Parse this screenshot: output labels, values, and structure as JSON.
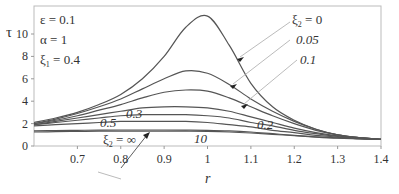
{
  "chart_data": {
    "type": "line",
    "title": "",
    "xlabel": "r",
    "ylabel": "τ",
    "xlim": [
      0.6,
      1.4
    ],
    "ylim": [
      0,
      12.5
    ],
    "xticks": [
      "0.7",
      "0.8",
      "0.9",
      "1",
      "1.1",
      "1.2",
      "1.3",
      "1.4"
    ],
    "yticks": [
      "0",
      "2",
      "4",
      "6",
      "8",
      "10"
    ],
    "grid": false,
    "parameters": [
      "ε = 0.1",
      "α = 1",
      "ξ₁ = 0.4"
    ],
    "legend_title": "ξ₂",
    "x": [
      0.6,
      0.65,
      0.7,
      0.75,
      0.8,
      0.85,
      0.9,
      0.95,
      1.0,
      1.05,
      1.1,
      1.15,
      1.2,
      1.25,
      1.3,
      1.35,
      1.4
    ],
    "series": [
      {
        "name": "ξ₂ = 0",
        "label": "ξ₂ = 0",
        "values": [
          2.1,
          2.5,
          3.0,
          3.7,
          4.6,
          6.0,
          8.0,
          10.6,
          11.6,
          9.0,
          5.6,
          3.5,
          2.3,
          1.5,
          1.0,
          0.75,
          0.6
        ]
      },
      {
        "name": "0.05",
        "label": "0.05",
        "values": [
          2.0,
          2.4,
          2.9,
          3.5,
          4.2,
          5.1,
          6.0,
          6.7,
          6.5,
          5.5,
          4.2,
          3.1,
          2.2,
          1.5,
          1.0,
          0.75,
          0.6
        ]
      },
      {
        "name": "0.1",
        "label": "0.1",
        "values": [
          2.0,
          2.3,
          2.7,
          3.2,
          3.7,
          4.3,
          4.8,
          5.0,
          4.9,
          4.3,
          3.5,
          2.7,
          2.0,
          1.4,
          1.0,
          0.75,
          0.6
        ]
      },
      {
        "name": "0.2",
        "label": "0.2",
        "values": [
          1.9,
          2.2,
          2.5,
          2.8,
          3.1,
          3.4,
          3.5,
          3.5,
          3.4,
          3.1,
          2.6,
          2.1,
          1.6,
          1.2,
          0.9,
          0.7,
          0.6
        ]
      },
      {
        "name": "0.3",
        "label": "0.3",
        "values": [
          1.9,
          2.1,
          2.3,
          2.5,
          2.7,
          2.8,
          2.8,
          2.8,
          2.7,
          2.5,
          2.1,
          1.8,
          1.4,
          1.1,
          0.85,
          0.7,
          0.6
        ]
      },
      {
        "name": "0.5",
        "label": "0.5",
        "values": [
          1.8,
          1.9,
          2.0,
          2.1,
          2.2,
          2.2,
          2.2,
          2.2,
          2.1,
          1.9,
          1.7,
          1.4,
          1.2,
          0.95,
          0.8,
          0.65,
          0.6
        ]
      },
      {
        "name": "10",
        "label": "10",
        "values": [
          1.35,
          1.38,
          1.4,
          1.42,
          1.43,
          1.43,
          1.43,
          1.42,
          1.4,
          1.35,
          1.25,
          1.1,
          0.95,
          0.82,
          0.72,
          0.65,
          0.6
        ]
      },
      {
        "name": "∞",
        "label": "ξ₂ = ∞",
        "values": [
          1.25,
          1.28,
          1.3,
          1.32,
          1.33,
          1.33,
          1.33,
          1.32,
          1.3,
          1.25,
          1.16,
          1.04,
          0.92,
          0.8,
          0.7,
          0.64,
          0.58
        ]
      }
    ]
  },
  "labels": {
    "y_axis": "τ",
    "x_axis": "r",
    "param_eps": "ε = 0.1",
    "param_alpha": "α = 1",
    "param_xi1_main": "ξ",
    "param_xi1_sub": "1",
    "param_xi1_val": " = 0.4",
    "xi2_0_main": "ξ",
    "xi2_0_sub": "2",
    "xi2_0_val": " = 0",
    "l005": "0.05",
    "l01": "0.1",
    "l02": "0.2",
    "l03": "0.3",
    "l05": "0.5",
    "l10": "10",
    "xi2_inf_main": "ξ",
    "xi2_inf_sub": "2",
    "xi2_inf_val": " = ∞"
  }
}
